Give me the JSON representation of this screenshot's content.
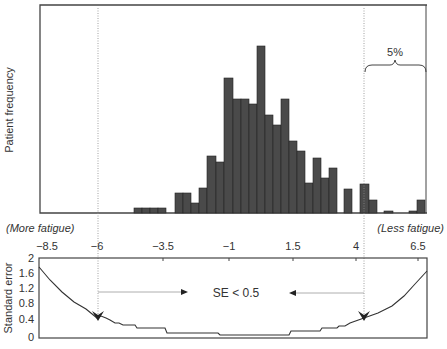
{
  "chart_data": [
    {
      "type": "bar",
      "title": "",
      "xlabel": "",
      "ylabel": "Patient frequency",
      "grid": false,
      "annotations": [
        "5%",
        "(More fatigue)",
        "(Less fatigue)"
      ],
      "bins_px": [
        {
          "x0": 134,
          "x1": 142,
          "top": 208
        },
        {
          "x0": 142,
          "x1": 150,
          "top": 208
        },
        {
          "x0": 150,
          "x1": 158,
          "top": 208
        },
        {
          "x0": 158,
          "x1": 166,
          "top": 208
        },
        {
          "x0": 175,
          "x1": 183,
          "top": 193
        },
        {
          "x0": 183,
          "x1": 191,
          "top": 193
        },
        {
          "x0": 191,
          "x1": 199,
          "top": 203
        },
        {
          "x0": 199,
          "x1": 207,
          "top": 188
        },
        {
          "x0": 207,
          "x1": 216,
          "top": 156
        },
        {
          "x0": 216,
          "x1": 224,
          "top": 162
        },
        {
          "x0": 224,
          "x1": 233,
          "top": 78
        },
        {
          "x0": 233,
          "x1": 241,
          "top": 99
        },
        {
          "x0": 241,
          "x1": 249,
          "top": 99
        },
        {
          "x0": 249,
          "x1": 257,
          "top": 104
        },
        {
          "x0": 257,
          "x1": 265,
          "top": 46
        },
        {
          "x0": 265,
          "x1": 273,
          "top": 115
        },
        {
          "x0": 273,
          "x1": 281,
          "top": 125
        },
        {
          "x0": 281,
          "x1": 289,
          "top": 99
        },
        {
          "x0": 289,
          "x1": 297,
          "top": 141
        },
        {
          "x0": 297,
          "x1": 305,
          "top": 151
        },
        {
          "x0": 305,
          "x1": 313,
          "top": 183
        },
        {
          "x0": 313,
          "x1": 321,
          "top": 158
        },
        {
          "x0": 321,
          "x1": 329,
          "top": 178
        },
        {
          "x0": 329,
          "x1": 337,
          "top": 168
        },
        {
          "x0": 344,
          "x1": 352,
          "top": 189
        },
        {
          "x0": 360,
          "x1": 369,
          "top": 184
        },
        {
          "x0": 369,
          "x1": 377,
          "top": 200
        },
        {
          "x0": 384,
          "x1": 393,
          "top": 211
        },
        {
          "x0": 409,
          "x1": 417,
          "top": 211
        },
        {
          "x0": 417,
          "x1": 425,
          "top": 200
        }
      ],
      "relative_frequency": [
        3,
        3,
        3,
        3,
        10,
        10,
        5,
        12,
        28,
        25,
        65,
        55,
        55,
        52,
        80,
        47,
        42,
        55,
        35,
        30,
        15,
        27,
        17,
        22,
        12,
        15,
        7,
        2,
        2,
        7
      ]
    },
    {
      "type": "line",
      "ylabel": "Standard error",
      "ylim": [
        0,
        2
      ],
      "yticks": [
        "0",
        "0.4",
        "0.8",
        "1.2",
        "1.6",
        "2"
      ],
      "xticks": [
        "-8.5",
        "-6",
        "-3.5",
        "-1",
        "1.5",
        "4",
        "6.5"
      ],
      "x": [
        -8.5,
        -6,
        -5,
        -3.5,
        -1,
        1.5,
        3,
        4,
        6.5
      ],
      "values": [
        1.8,
        0.48,
        0.3,
        0.2,
        0.1,
        0.1,
        0.3,
        0.48,
        1.7
      ],
      "annotations": [
        "SE < 0.5"
      ]
    }
  ],
  "labels": {
    "top_ylabel": "Patient frequency",
    "bottom_ylabel": "Standard error",
    "more_fatigue": "(More fatigue)",
    "less_fatigue": "(Less fatigue)",
    "five_percent": "5%",
    "se_label": "SE < 0.5",
    "xticks": [
      "−8.5",
      "−6",
      "−3.5",
      "−1",
      "1.5",
      "4",
      "6.5"
    ],
    "yticks": [
      "2",
      "1.6",
      "1.2",
      "0.8",
      "0.4",
      "0"
    ]
  },
  "colors": {
    "bar": "#4a4a4a",
    "axis": "#333333",
    "guide": "#999999"
  }
}
